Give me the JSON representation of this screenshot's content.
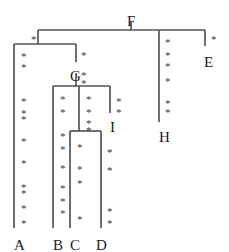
{
  "figure": {
    "type": "cladogram",
    "width": 229,
    "height": 252,
    "background_color": "#ffffff",
    "line_color": "#555555",
    "text_color": "#1a1a1a",
    "mark_color": "#3a3a3a",
    "mark_glyph": "*"
  },
  "taxa": [
    {
      "id": "A",
      "label": "A",
      "x": 14,
      "y": 238
    },
    {
      "id": "B",
      "label": "B",
      "x": 53,
      "y": 238
    },
    {
      "id": "C",
      "label": "C",
      "x": 70,
      "y": 238
    },
    {
      "id": "D",
      "label": "D",
      "x": 96,
      "y": 238
    }
  ],
  "internal_nodes": [
    {
      "id": "F",
      "label": "F",
      "x": 127,
      "y": 14
    },
    {
      "id": "E",
      "label": "E",
      "x": 204,
      "y": 55
    },
    {
      "id": "G",
      "label": "G",
      "x": 70,
      "y": 69
    },
    {
      "id": "I",
      "label": "I",
      "x": 110,
      "y": 120
    },
    {
      "id": "H",
      "label": "H",
      "x": 159,
      "y": 130
    }
  ],
  "edges": [
    {
      "name": "root-stem-F",
      "points": "131,21 131,30"
    },
    {
      "name": "crown-bar-top",
      "points": "38,30 205,30"
    },
    {
      "name": "branch-to-clade-AG",
      "points": "38,30 38,44"
    },
    {
      "name": "clade-bar-AG",
      "points": "14,44 76,44"
    },
    {
      "name": "terminal-A",
      "points": "14,44 14,228"
    },
    {
      "name": "branch-to-G",
      "points": "76,44 76,62"
    },
    {
      "name": "stem-G",
      "points": "76,73 76,86"
    },
    {
      "name": "clade-bar-G",
      "points": "53,86 110,86"
    },
    {
      "name": "terminal-B",
      "points": "53,86 53,228"
    },
    {
      "name": "branch-to-I",
      "points": "110,86 110,113"
    },
    {
      "name": "inner-bar-CD-stem",
      "points": "79,86 79,131"
    },
    {
      "name": "clade-bar-CD",
      "points": "70,131 101,131"
    },
    {
      "name": "terminal-C",
      "points": "70,131 70,228"
    },
    {
      "name": "terminal-D",
      "points": "101,131 101,228"
    },
    {
      "name": "terminal-H",
      "points": "159,30 159,122"
    },
    {
      "name": "branch-to-E",
      "points": "205,30 205,46"
    }
  ],
  "marks": [
    {
      "branch": "crown-left",
      "x": 31,
      "y": 34
    },
    {
      "branch": "A",
      "x": 21,
      "y": 51
    },
    {
      "branch": "A",
      "x": 21,
      "y": 62
    },
    {
      "branch": "A",
      "x": 21,
      "y": 96
    },
    {
      "branch": "A",
      "x": 21,
      "y": 108
    },
    {
      "branch": "A",
      "x": 21,
      "y": 114
    },
    {
      "branch": "A",
      "x": 21,
      "y": 136
    },
    {
      "branch": "A",
      "x": 21,
      "y": 158
    },
    {
      "branch": "A",
      "x": 21,
      "y": 182
    },
    {
      "branch": "A",
      "x": 21,
      "y": 188
    },
    {
      "branch": "A",
      "x": 21,
      "y": 203
    },
    {
      "branch": "A",
      "x": 21,
      "y": 218
    },
    {
      "branch": "G-stem",
      "x": 81,
      "y": 50
    },
    {
      "branch": "G-stem",
      "x": 81,
      "y": 70
    },
    {
      "branch": "G-stem",
      "x": 81,
      "y": 78
    },
    {
      "branch": "B",
      "x": 60,
      "y": 94
    },
    {
      "branch": "B",
      "x": 60,
      "y": 107
    },
    {
      "branch": "B",
      "x": 60,
      "y": 131
    },
    {
      "branch": "B",
      "x": 60,
      "y": 144
    },
    {
      "branch": "B",
      "x": 60,
      "y": 163
    },
    {
      "branch": "B",
      "x": 60,
      "y": 183
    },
    {
      "branch": "B",
      "x": 60,
      "y": 196
    },
    {
      "branch": "B",
      "x": 60,
      "y": 208
    },
    {
      "branch": "CD-stem",
      "x": 86,
      "y": 94
    },
    {
      "branch": "CD-stem",
      "x": 86,
      "y": 107
    },
    {
      "branch": "CD-stem",
      "x": 86,
      "y": 118
    },
    {
      "branch": "CD-stem",
      "x": 86,
      "y": 125
    },
    {
      "branch": "C",
      "x": 77,
      "y": 142
    },
    {
      "branch": "C",
      "x": 77,
      "y": 164
    },
    {
      "branch": "C",
      "x": 77,
      "y": 178
    },
    {
      "branch": "C",
      "x": 77,
      "y": 214
    },
    {
      "branch": "I-branch",
      "x": 116,
      "y": 96
    },
    {
      "branch": "I-branch",
      "x": 116,
      "y": 107
    },
    {
      "branch": "D",
      "x": 107,
      "y": 147
    },
    {
      "branch": "D",
      "x": 107,
      "y": 165
    },
    {
      "branch": "D",
      "x": 107,
      "y": 206
    },
    {
      "branch": "D",
      "x": 107,
      "y": 218
    },
    {
      "branch": "H",
      "x": 165,
      "y": 37
    },
    {
      "branch": "H",
      "x": 165,
      "y": 50
    },
    {
      "branch": "H",
      "x": 165,
      "y": 61
    },
    {
      "branch": "H",
      "x": 165,
      "y": 76
    },
    {
      "branch": "H",
      "x": 165,
      "y": 98
    },
    {
      "branch": "H",
      "x": 165,
      "y": 107
    },
    {
      "branch": "E",
      "x": 211,
      "y": 34
    }
  ]
}
